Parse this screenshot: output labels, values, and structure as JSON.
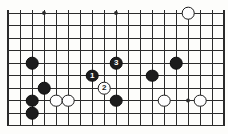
{
  "figure": {
    "kind": "go-board-diagram",
    "title": "",
    "background_color": "#fdfdfb",
    "line_color": "#2b2b2b",
    "black_color": "#1c1c1c",
    "white_color": "#fdfdfd"
  },
  "board": {
    "left": 8,
    "top": 13,
    "right": 220,
    "bottom": 125.5,
    "columns": 18,
    "rows": 10,
    "col_spacing": 12,
    "row_spacing": 12.5,
    "edges": {
      "top": false,
      "left": true,
      "right": true,
      "bottom": true
    },
    "border_width": 2.2,
    "line_width": 1.0,
    "star_points": [
      {
        "col": 3,
        "row": 0
      },
      {
        "col": 9,
        "row": 0
      },
      {
        "col": 9,
        "row": 7
      },
      {
        "col": 15,
        "row": 7
      }
    ]
  },
  "stones": [
    {
      "name": "white-stone-top-right",
      "color": "white",
      "col": 15,
      "row": 0,
      "label": ""
    },
    {
      "name": "black-stone-left-upper",
      "color": "black",
      "col": 2,
      "row": 4,
      "label": ""
    },
    {
      "name": "black-stone-move-3",
      "color": "black",
      "col": 9,
      "row": 4,
      "label": "3"
    },
    {
      "name": "black-stone-right-upper",
      "color": "black",
      "col": 14,
      "row": 4,
      "label": ""
    },
    {
      "name": "black-stone-move-1",
      "color": "black",
      "col": 7,
      "row": 5,
      "label": "1"
    },
    {
      "name": "black-stone-right-mid",
      "color": "black",
      "col": 12,
      "row": 5,
      "label": ""
    },
    {
      "name": "black-stone-left-hane",
      "color": "black",
      "col": 3,
      "row": 6,
      "label": ""
    },
    {
      "name": "white-stone-move-2",
      "color": "white",
      "col": 8,
      "row": 6,
      "label": "2"
    },
    {
      "name": "black-stone-left-corner",
      "color": "black",
      "col": 2,
      "row": 7,
      "label": ""
    },
    {
      "name": "white-stone-left-corner-a",
      "color": "white",
      "col": 4,
      "row": 7,
      "label": ""
    },
    {
      "name": "white-stone-left-corner-b",
      "color": "white",
      "col": 5,
      "row": 7,
      "label": ""
    },
    {
      "name": "black-stone-center-low",
      "color": "black",
      "col": 9,
      "row": 7,
      "label": ""
    },
    {
      "name": "white-stone-right-low-a",
      "color": "white",
      "col": 13,
      "row": 7,
      "label": ""
    },
    {
      "name": "white-stone-right-low-b",
      "color": "white",
      "col": 16,
      "row": 7,
      "label": ""
    },
    {
      "name": "black-stone-bottom-left",
      "color": "black",
      "col": 2,
      "row": 8,
      "label": ""
    }
  ]
}
